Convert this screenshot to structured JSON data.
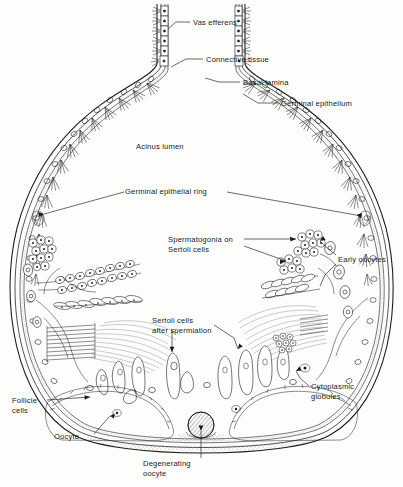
{
  "figure": {
    "domain_note": "black-and-white line drawing, biological diagram",
    "background_color": "#fdfdfc",
    "ink_color": "#1a1a1a",
    "width": 403,
    "height": 487
  },
  "labels": [
    {
      "id": "vas-efferens",
      "text": "Vas efferens",
      "text2": "",
      "x": 193,
      "y": 22,
      "anchor": "start"
    },
    {
      "id": "connective-tissue",
      "text": "Connective tissue",
      "text2": "",
      "x": 206,
      "y": 61,
      "anchor": "start"
    },
    {
      "id": "basal-lamina",
      "text": "Basal lamina",
      "text2": "",
      "x": 243,
      "y": 84,
      "anchor": "start"
    },
    {
      "id": "germinal-epithelium",
      "text": "Germinal epithelium",
      "text2": "",
      "x": 281,
      "y": 105,
      "anchor": "start"
    },
    {
      "id": "acinus-lumen",
      "text": "Acinus lumen",
      "text2": "",
      "x": 136,
      "y": 146,
      "anchor": "start"
    },
    {
      "id": "germinal-epithelial-ring",
      "text": "Germinal epithelial ring",
      "text2": "",
      "x": 125,
      "y": 191,
      "anchor": "start"
    },
    {
      "id": "spermatogonia",
      "text": "Spermatogonia on",
      "text2": "Sertoli cells",
      "x": 168,
      "y": 242,
      "anchor": "start"
    },
    {
      "id": "early-oocytes",
      "text": "Early oocytes",
      "text2": "",
      "x": 338,
      "y": 259,
      "anchor": "start"
    },
    {
      "id": "sertoli-cells",
      "text": "Sertoli cells",
      "text2": "after spermiation",
      "x": 152,
      "y": 323,
      "anchor": "start"
    },
    {
      "id": "cytoplasmic-globules",
      "text": "Cytoplasmic",
      "text2": "globules",
      "x": 311,
      "y": 389,
      "anchor": "start"
    },
    {
      "id": "follicle-cells",
      "text": "Follicle",
      "text2": "cells",
      "x": 12,
      "y": 403,
      "anchor": "start"
    },
    {
      "id": "oocyte",
      "text": "Oocyte",
      "text2": "",
      "x": 54,
      "y": 439,
      "anchor": "start"
    },
    {
      "id": "degenerating-oocyte",
      "text": "Degenerating",
      "text2": "oocyte",
      "x": 143,
      "y": 463,
      "anchor": "start"
    }
  ],
  "structures": [
    {
      "id": "vas-efferens-duct",
      "name": "Vas efferens duct",
      "region": "top-neck"
    },
    {
      "id": "acinus-wall",
      "name": "Acinus wall (basal lamina + connective tissue)",
      "region": "outline"
    },
    {
      "id": "germinal-epithelium",
      "name": "Germinal epithelium with ciliated cells",
      "region": "inner-wall"
    },
    {
      "id": "acinus-lumen",
      "name": "Acinus lumen (central cavity)",
      "region": "centre"
    },
    {
      "id": "germinal-epithelial-ring-left",
      "name": "Germinal epithelial ring",
      "region": "left-mid"
    },
    {
      "id": "germinal-epithelial-ring-right",
      "name": "Germinal epithelial ring",
      "region": "right-mid"
    },
    {
      "id": "spermatogonia-cluster-left",
      "name": "Spermatogonia on Sertoli cells",
      "region": "left"
    },
    {
      "id": "spermatogonia-cluster-right",
      "name": "Spermatogonia on Sertoli cells",
      "region": "right"
    },
    {
      "id": "spermatid-rows-left",
      "name": "Elongating spermatids in rows",
      "region": "left"
    },
    {
      "id": "spermatid-rows-right",
      "name": "Elongating spermatids in rows",
      "region": "right"
    },
    {
      "id": "spermatozoa-bundle-left",
      "name": "Spermatozoa bundle",
      "region": "left-lower"
    },
    {
      "id": "spermatozoa-bundle-right",
      "name": "Spermatozoa bundle",
      "region": "right-lower"
    },
    {
      "id": "sertoli-cells-row",
      "name": "Sertoli cells after spermiation",
      "region": "bottom-band"
    },
    {
      "id": "early-oocytes-group",
      "name": "Early oocytes in wall",
      "region": "right-wall"
    },
    {
      "id": "oocyte-left",
      "name": "Oocyte with follicle cells",
      "region": "bottom-left"
    },
    {
      "id": "oocyte-right",
      "name": "Oocyte with follicle cells",
      "region": "bottom-right"
    },
    {
      "id": "degenerating-oocyte-body",
      "name": "Degenerating oocyte (hatched)",
      "region": "bottom-centre"
    },
    {
      "id": "cytoplasmic-globules-group",
      "name": "Cytoplasmic globules",
      "region": "right-lower-wall"
    }
  ]
}
